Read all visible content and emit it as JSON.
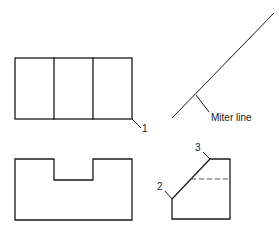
{
  "diagram": {
    "type": "orthographic-projection",
    "views": {
      "top": {
        "name": "top-view",
        "divisions": 3
      },
      "front": {
        "name": "front-view",
        "feature": "center notch"
      },
      "side": {
        "name": "side-view",
        "feature": "chamfer with hidden line"
      }
    },
    "labels": {
      "miter": "Miter line",
      "point1": "1",
      "point2": "2",
      "point3": "3"
    },
    "colors": {
      "line": "#1a1a1a",
      "hidden_line": "#555555",
      "background": "#ffffff"
    }
  }
}
